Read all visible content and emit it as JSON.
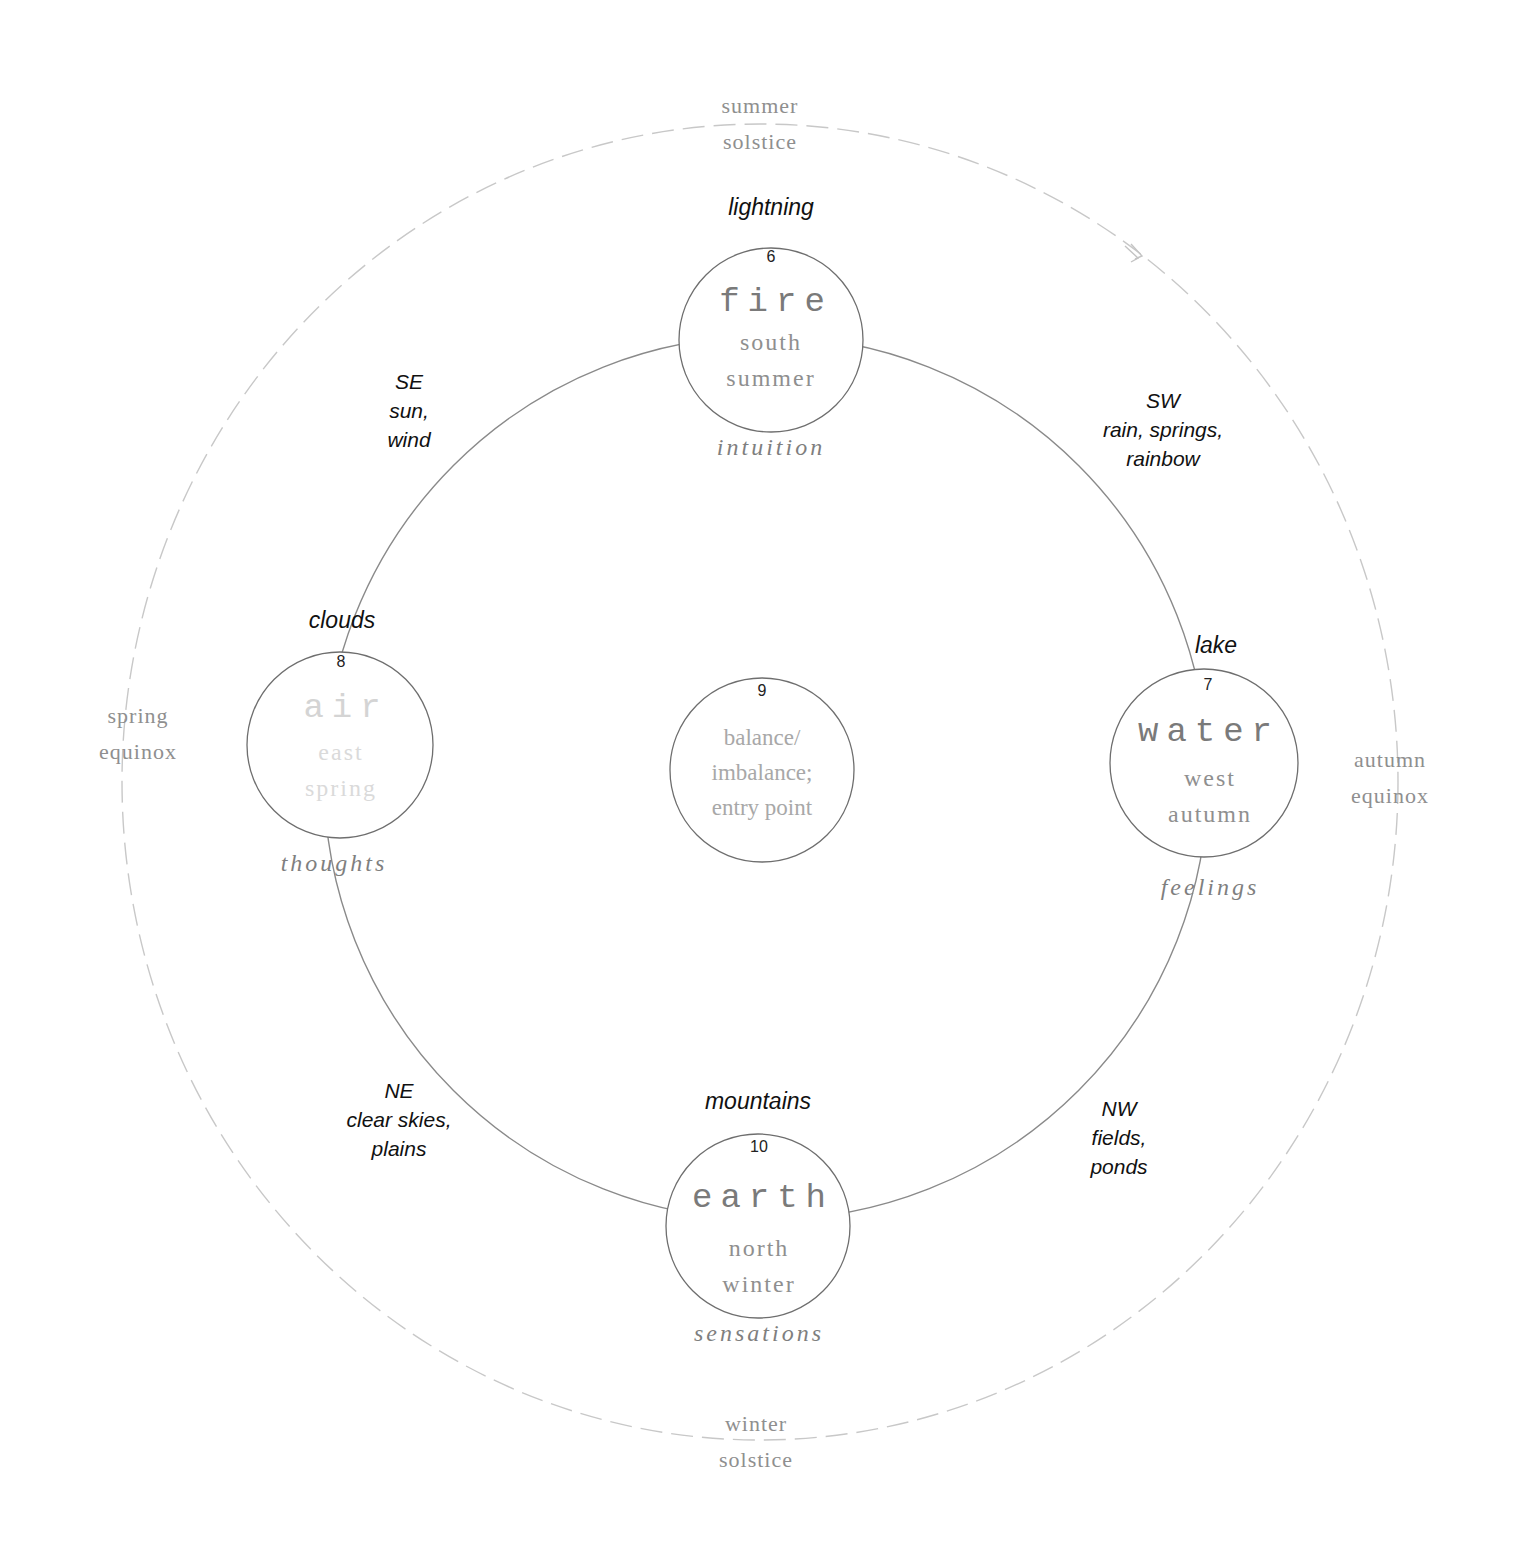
{
  "colors": {
    "background": "#ffffff",
    "outer_ring": "#c8c8c8",
    "inner_ring": "#8a8a8a",
    "node_outline": "#6e6e6e",
    "season_text": "#8f8f8f",
    "element_text": "#7a7a7a",
    "faded_text": "#d4d4d4",
    "feature_text": "#111111"
  },
  "outer_ring": {
    "style": "dashed",
    "direction_arrow": "clockwise-arrow",
    "labels": {
      "top": [
        "summer",
        "solstice"
      ],
      "right": [
        "autumn",
        "equinox"
      ],
      "bottom": [
        "winter",
        "solstice"
      ],
      "left": [
        "spring",
        "equinox"
      ]
    }
  },
  "nodes": {
    "fire": {
      "number": "6",
      "element": "fire",
      "direction": "south",
      "season": "summer",
      "function": "intuition",
      "feature": "lightning"
    },
    "water": {
      "number": "7",
      "element": "water",
      "direction": "west",
      "season": "autumn",
      "function": "feelings",
      "feature": "lake"
    },
    "air": {
      "number": "8",
      "element": "air",
      "direction": "east",
      "season": "spring",
      "function": "thoughts",
      "feature": "clouds"
    },
    "center": {
      "number": "9",
      "lines": [
        "balance/",
        "imbalance;",
        "entry point"
      ]
    },
    "earth": {
      "number": "10",
      "element": "earth",
      "direction": "north",
      "season": "winter",
      "function": "sensations",
      "feature": "mountains"
    }
  },
  "intercardinals": {
    "se": {
      "dir": "SE",
      "lines": [
        "sun,",
        "wind"
      ]
    },
    "sw": {
      "dir": "SW",
      "lines": [
        "rain, springs,",
        "rainbow"
      ]
    },
    "ne": {
      "dir": "NE",
      "lines": [
        "clear skies,",
        "plains"
      ]
    },
    "nw": {
      "dir": "NW",
      "lines": [
        "fields,",
        "ponds"
      ]
    }
  }
}
